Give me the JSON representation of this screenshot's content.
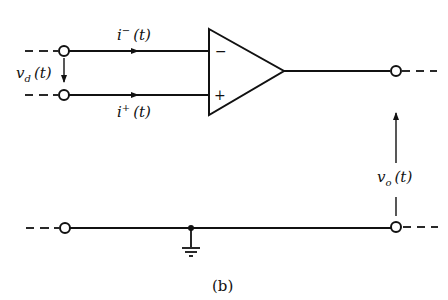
{
  "figure_label": "(b)",
  "labels": {
    "i_minus": {
      "var": "i",
      "sup": "−",
      "arg": "(t)"
    },
    "i_plus": {
      "var": "i",
      "sup": "+",
      "arg": "(t)"
    },
    "v_d": {
      "var": "v",
      "sub": "d",
      "arg": "(t)"
    },
    "v_o": {
      "var": "v",
      "sub": "o",
      "arg": "(t)"
    },
    "minus_sign": "−",
    "plus_sign": "+"
  },
  "colors": {
    "stroke": "#111111",
    "background": "#ffffff"
  }
}
